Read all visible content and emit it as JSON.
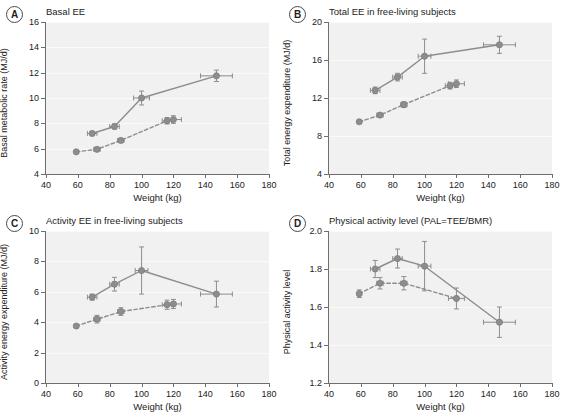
{
  "figure": {
    "shared_xlabel": "Weight (kg)",
    "xlim": [
      40,
      180
    ],
    "xticks": [
      40,
      60,
      80,
      100,
      120,
      140,
      160,
      180
    ],
    "marker_color": "#8d8d8d",
    "line_color": "#8d8d8d",
    "plot_background": "#f1f1f1",
    "axis_color": "#6e6e6e"
  },
  "chart_data": [
    {
      "type": "line",
      "panel": "A",
      "title": "Basal EE",
      "xlabel": "Weight (kg)",
      "ylabel": "Basal metabolic rate (MJ/d)",
      "xlim": [
        40,
        180
      ],
      "ylim": [
        4,
        16
      ],
      "xticks": [
        40,
        60,
        80,
        100,
        120,
        140,
        160,
        180
      ],
      "yticks": [
        4,
        6,
        8,
        10,
        12,
        14,
        16
      ],
      "grid": true,
      "legend": "none",
      "series": [
        {
          "name": "solid-series",
          "style": "solid",
          "x": [
            69,
            83,
            100,
            147
          ],
          "y": [
            7.2,
            7.75,
            10.0,
            11.75
          ],
          "yerr": [
            0.15,
            0.2,
            0.55,
            0.45
          ],
          "xerr": [
            3,
            3,
            5,
            10
          ]
        },
        {
          "name": "dashed-series",
          "style": "dashed",
          "x": [
            59,
            72,
            87,
            116,
            120
          ],
          "y": [
            5.75,
            5.95,
            6.65,
            8.2,
            8.3
          ],
          "yerr": [
            0.1,
            0.12,
            0.15,
            0.25,
            0.3
          ],
          "xerr": [
            0,
            2,
            2,
            3,
            5
          ]
        }
      ]
    },
    {
      "type": "line",
      "panel": "B",
      "title": "Total EE in free-living subjects",
      "xlabel": "Weight (kg)",
      "ylabel": "Total energy expenditure (MJ/d)",
      "xlim": [
        40,
        180
      ],
      "ylim": [
        4,
        20
      ],
      "xticks": [
        40,
        60,
        80,
        100,
        120,
        140,
        160,
        180
      ],
      "yticks": [
        4,
        8,
        12,
        16,
        20
      ],
      "grid": true,
      "legend": "none",
      "series": [
        {
          "name": "solid-series",
          "style": "solid",
          "x": [
            69,
            83,
            100,
            147
          ],
          "y": [
            12.8,
            14.2,
            16.4,
            17.6
          ],
          "yerr": [
            0.35,
            0.4,
            1.8,
            0.9
          ],
          "xerr": [
            3,
            3,
            4,
            10
          ]
        },
        {
          "name": "dashed-series",
          "style": "dashed",
          "x": [
            59,
            72,
            87,
            116,
            120
          ],
          "y": [
            9.5,
            10.2,
            11.3,
            13.3,
            13.5
          ],
          "yerr": [
            0.15,
            0.2,
            0.3,
            0.35,
            0.4
          ],
          "xerr": [
            0,
            2,
            2,
            3,
            5
          ]
        }
      ]
    },
    {
      "type": "line",
      "panel": "C",
      "title": "Activity EE in free-living subjects",
      "xlabel": "Weight (kg)",
      "ylabel": "Activity energy expenditure (MJ/d)",
      "xlim": [
        40,
        180
      ],
      "ylim": [
        0,
        10
      ],
      "xticks": [
        40,
        60,
        80,
        100,
        120,
        140,
        160,
        180
      ],
      "yticks": [
        0,
        2,
        4,
        6,
        8,
        10
      ],
      "grid": true,
      "legend": "none",
      "series": [
        {
          "name": "solid-series",
          "style": "solid",
          "x": [
            69,
            83,
            100,
            147
          ],
          "y": [
            5.65,
            6.5,
            7.4,
            5.85
          ],
          "yerr": [
            0.2,
            0.45,
            1.55,
            0.85
          ],
          "xerr": [
            3,
            3,
            4,
            10
          ]
        },
        {
          "name": "dashed-series",
          "style": "dashed",
          "x": [
            59,
            72,
            87,
            116,
            120
          ],
          "y": [
            3.75,
            4.2,
            4.7,
            5.15,
            5.2
          ],
          "yerr": [
            0.1,
            0.25,
            0.25,
            0.3,
            0.3
          ],
          "xerr": [
            0,
            2,
            2,
            3,
            5
          ]
        }
      ]
    },
    {
      "type": "line",
      "panel": "D",
      "title": "Physical activity level (PAL=TEE/BMR)",
      "xlabel": "Weight (kg)",
      "ylabel": "Physical activity level",
      "xlim": [
        40,
        180
      ],
      "ylim": [
        1.2,
        2.0
      ],
      "xticks": [
        40,
        60,
        80,
        100,
        120,
        140,
        160,
        180
      ],
      "yticks": [
        1.2,
        1.4,
        1.6,
        1.8,
        2.0
      ],
      "ytick_labels": [
        "1.2",
        "1.4",
        "1.6",
        "1.8",
        "2.0"
      ],
      "grid": true,
      "legend": "none",
      "series": [
        {
          "name": "solid-series",
          "style": "solid",
          "x": [
            69,
            83,
            100,
            147
          ],
          "y": [
            1.8,
            1.855,
            1.815,
            1.52
          ],
          "yerr": [
            0.045,
            0.05,
            0.13,
            0.08
          ],
          "xerr": [
            3,
            3,
            4,
            10
          ]
        },
        {
          "name": "dashed-series",
          "style": "dashed",
          "x": [
            59,
            72,
            87,
            120
          ],
          "y": [
            1.67,
            1.725,
            1.725,
            1.645
          ],
          "yerr": [
            0.02,
            0.03,
            0.035,
            0.055
          ],
          "xerr": [
            0,
            2,
            2,
            5
          ]
        }
      ]
    }
  ],
  "panels": {
    "A": {
      "badge": "A"
    },
    "B": {
      "badge": "B"
    },
    "C": {
      "badge": "C"
    },
    "D": {
      "badge": "D"
    }
  }
}
